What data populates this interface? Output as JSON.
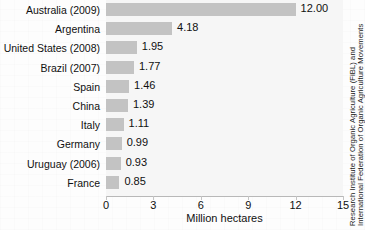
{
  "chart_data": {
    "type": "bar",
    "orientation": "horizontal",
    "title": "",
    "subtitle": "",
    "xlabel": "Million hectares",
    "ylabel": "",
    "xlim": [
      0,
      15
    ],
    "xticks": [
      0,
      3,
      6,
      9,
      12,
      15
    ],
    "xtick_labels": [
      "0",
      "3",
      "6",
      "9",
      "12",
      "15"
    ],
    "grid": false,
    "legend": false,
    "categories": [
      "Australia (2009)",
      "Argentina",
      "United States (2008)",
      "Brazil (2007)",
      "Spain",
      "China",
      "Italy",
      "Germany",
      "Uruguay (2006)",
      "France"
    ],
    "values": [
      12.0,
      4.18,
      1.95,
      1.77,
      1.46,
      1.39,
      1.11,
      0.99,
      0.93,
      0.85
    ],
    "value_labels": [
      "12.00",
      "4.18",
      "1.95",
      "1.77",
      "1.46",
      "1.39",
      "1.11",
      "0.99",
      "0.93",
      "0.85"
    ],
    "bar_color": "#c3c3c3",
    "plot_background": "#f6f6f6",
    "text_color": "#101010"
  },
  "source_note": {
    "line1": "Research Institute of Organic Agriculture (FiBL) and",
    "line2": "International Federation of Organic Agriculture Movements"
  }
}
